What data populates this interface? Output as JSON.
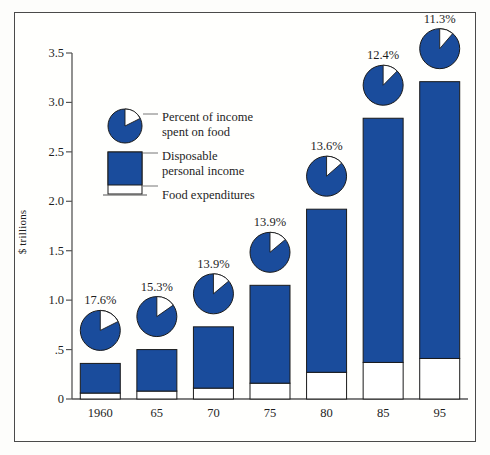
{
  "chart_data": {
    "type": "bar",
    "title": "",
    "xlabel": "",
    "ylabel": "$ trillions",
    "categories": [
      "1960",
      "65",
      "70",
      "75",
      "80",
      "85",
      "95"
    ],
    "ylim": [
      0,
      3.5
    ],
    "yticks": [
      0,
      0.5,
      1.0,
      1.5,
      2.0,
      2.5,
      3.0,
      3.5
    ],
    "ytick_labels": [
      "0",
      ".5",
      "1.0",
      "1.5",
      "2.0",
      "2.5",
      "3.0",
      "3.5"
    ],
    "grid": false,
    "legend_position": "inside-upper-left",
    "series": [
      {
        "name": "Disposable personal income",
        "values": [
          0.36,
          0.5,
          0.73,
          1.15,
          1.92,
          2.84,
          3.21
        ]
      },
      {
        "name": "Food expenditures",
        "values": [
          0.06,
          0.08,
          0.11,
          0.16,
          0.27,
          0.37,
          0.41
        ]
      },
      {
        "name": "Percent of income spent on food",
        "values": [
          17.6,
          15.3,
          13.9,
          13.9,
          13.6,
          12.4,
          11.3
        ]
      }
    ],
    "data_labels": [
      "17.6%",
      "15.3%",
      "13.9%",
      "13.9%",
      "13.6%",
      "12.4%",
      "11.3%"
    ],
    "colors": {
      "bar_blue": "#1A4C9C",
      "bar_white": "#FFFFFF",
      "outline": "#1a1a1a",
      "frame": "#4a4a4a"
    }
  },
  "legend": {
    "pie_label": "Percent of income\nspent on food",
    "bar_label": "Disposable\npersonal income",
    "base_label": "Food expenditures"
  },
  "axis": {
    "y_title": "$ trillions"
  }
}
